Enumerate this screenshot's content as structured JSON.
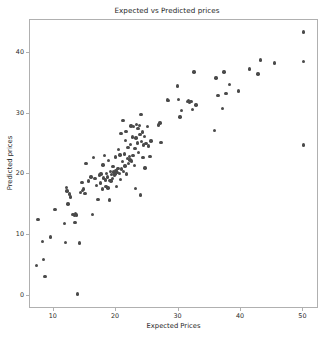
{
  "chart_data": {
    "type": "scatter",
    "title": "Expected vs Predicted prices",
    "xlabel": "Expected Prices",
    "ylabel": "Predicted prices",
    "xlim": [
      6.2,
      52.5
    ],
    "ylim": [
      -2.2,
      45.5
    ],
    "xticks": [
      10,
      20,
      30,
      40,
      50
    ],
    "yticks": [
      0,
      10,
      20,
      30,
      40
    ],
    "grid": false,
    "legend": null,
    "marker_color": "#4a4a4a",
    "marker_size": 3.4,
    "frame_color": "#b0b0b0",
    "background": "#ffffff",
    "series": [
      {
        "name": "predictions",
        "points": [
          [
            7.2,
            5.0
          ],
          [
            7.5,
            12.6
          ],
          [
            8.2,
            8.9
          ],
          [
            8.4,
            6.0
          ],
          [
            8.6,
            3.2
          ],
          [
            9.5,
            9.7
          ],
          [
            10.2,
            14.2
          ],
          [
            11.7,
            11.9
          ],
          [
            11.9,
            8.8
          ],
          [
            12.0,
            17.9
          ],
          [
            12.1,
            17.3
          ],
          [
            12.3,
            15.1
          ],
          [
            12.5,
            16.8
          ],
          [
            12.7,
            16.3
          ],
          [
            13.1,
            13.4
          ],
          [
            13.3,
            13.2
          ],
          [
            13.4,
            12.1
          ],
          [
            13.5,
            13.5
          ],
          [
            13.6,
            13.3
          ],
          [
            13.8,
            0.3
          ],
          [
            14.1,
            8.7
          ],
          [
            14.3,
            17.0
          ],
          [
            14.5,
            18.7
          ],
          [
            14.6,
            17.4
          ],
          [
            14.8,
            17.6
          ],
          [
            15.0,
            16.9
          ],
          [
            15.2,
            21.8
          ],
          [
            15.6,
            18.9
          ],
          [
            16.0,
            19.6
          ],
          [
            16.2,
            13.4
          ],
          [
            16.4,
            22.8
          ],
          [
            16.6,
            19.3
          ],
          [
            16.9,
            18.2
          ],
          [
            17.1,
            15.9
          ],
          [
            17.3,
            19.9
          ],
          [
            17.5,
            18.6
          ],
          [
            17.6,
            20.1
          ],
          [
            17.8,
            17.6
          ],
          [
            17.9,
            21.6
          ],
          [
            18.0,
            19.4
          ],
          [
            18.1,
            23.1
          ],
          [
            18.3,
            19.1
          ],
          [
            18.4,
            18.0
          ],
          [
            18.5,
            20.2
          ],
          [
            18.6,
            19.6
          ],
          [
            18.7,
            17.8
          ],
          [
            18.8,
            22.3
          ],
          [
            18.9,
            15.8
          ],
          [
            19.0,
            19.0
          ],
          [
            19.1,
            20.5
          ],
          [
            19.2,
            18.9
          ],
          [
            19.3,
            20.0
          ],
          [
            19.4,
            19.3
          ],
          [
            19.5,
            21.3
          ],
          [
            19.6,
            20.4
          ],
          [
            19.7,
            19.8
          ],
          [
            19.8,
            20.1
          ],
          [
            19.9,
            22.9
          ],
          [
            20.0,
            20.6
          ],
          [
            20.1,
            18.0
          ],
          [
            20.2,
            20.3
          ],
          [
            20.3,
            21.0
          ],
          [
            20.4,
            24.1
          ],
          [
            20.5,
            20.2
          ],
          [
            20.6,
            23.2
          ],
          [
            20.7,
            19.2
          ],
          [
            20.8,
            26.8
          ],
          [
            20.9,
            20.9
          ],
          [
            21.0,
            22.1
          ],
          [
            21.1,
            28.9
          ],
          [
            21.2,
            20.5
          ],
          [
            21.3,
            23.4
          ],
          [
            21.4,
            21.4
          ],
          [
            21.5,
            25.6
          ],
          [
            21.6,
            27.1
          ],
          [
            21.7,
            20.1
          ],
          [
            21.8,
            22.6
          ],
          [
            21.9,
            24.5
          ],
          [
            22.0,
            21.8
          ],
          [
            22.1,
            23.0
          ],
          [
            22.2,
            22.4
          ],
          [
            22.3,
            25.0
          ],
          [
            22.4,
            28.0
          ],
          [
            22.5,
            22.2
          ],
          [
            22.6,
            26.2
          ],
          [
            22.7,
            23.1
          ],
          [
            22.8,
            27.9
          ],
          [
            22.9,
            21.5
          ],
          [
            23.0,
            24.3
          ],
          [
            23.1,
            17.7
          ],
          [
            23.2,
            26.0
          ],
          [
            23.3,
            28.3
          ],
          [
            23.4,
            25.2
          ],
          [
            23.5,
            27.6
          ],
          [
            23.6,
            23.6
          ],
          [
            23.7,
            28.1
          ],
          [
            23.8,
            26.6
          ],
          [
            23.9,
            16.6
          ],
          [
            24.0,
            29.9
          ],
          [
            24.1,
            25.4
          ],
          [
            24.2,
            27.0
          ],
          [
            24.3,
            22.8
          ],
          [
            24.4,
            24.9
          ],
          [
            24.5,
            26.3
          ],
          [
            24.6,
            21.1
          ],
          [
            24.8,
            25.1
          ],
          [
            25.0,
            27.9
          ],
          [
            25.2,
            24.7
          ],
          [
            25.4,
            23.0
          ],
          [
            25.6,
            25.5
          ],
          [
            26.8,
            28.2
          ],
          [
            27.0,
            28.5
          ],
          [
            27.2,
            25.3
          ],
          [
            28.2,
            32.3
          ],
          [
            28.4,
            32.2
          ],
          [
            29.8,
            34.6
          ],
          [
            30.0,
            32.4
          ],
          [
            30.2,
            29.5
          ],
          [
            30.5,
            30.6
          ],
          [
            31.4,
            32.0
          ],
          [
            31.6,
            32.2
          ],
          [
            31.8,
            31.9
          ],
          [
            32.0,
            32.1
          ],
          [
            32.2,
            30.7
          ],
          [
            32.5,
            36.9
          ],
          [
            32.8,
            31.5
          ],
          [
            35.8,
            27.3
          ],
          [
            36.0,
            35.9
          ],
          [
            36.3,
            33.0
          ],
          [
            37.0,
            30.9
          ],
          [
            37.3,
            36.9
          ],
          [
            37.6,
            33.4
          ],
          [
            38.2,
            34.9
          ],
          [
            39.6,
            33.8
          ],
          [
            41.4,
            37.4
          ],
          [
            42.7,
            36.6
          ],
          [
            43.1,
            38.9
          ],
          [
            45.4,
            38.4
          ],
          [
            50.0,
            43.5
          ],
          [
            50.0,
            38.7
          ],
          [
            50.0,
            24.9
          ]
        ]
      }
    ]
  }
}
